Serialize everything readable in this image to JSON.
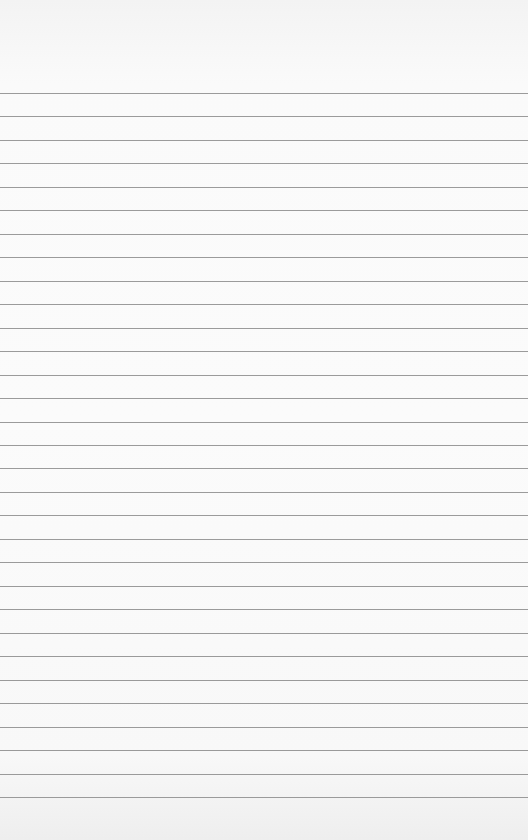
{
  "paper": {
    "kind": "lined-notebook-paper",
    "line_count": 31,
    "line_color": "#8a8a8a",
    "background_color": "#f9f9f9"
  }
}
